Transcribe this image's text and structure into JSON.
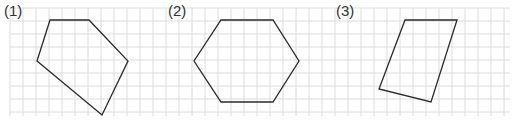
{
  "problems": [
    {
      "label": "(1)",
      "shape": "pentagon",
      "points": "50,20 89,20 128,61 102,115 37,61"
    },
    {
      "label": "(2)",
      "shape": "hexagon",
      "points": "221,20 273,20 299,61 273,102 221,102 194,61"
    },
    {
      "label": "(3)",
      "shape": "quadrilateral",
      "points": "405,20 457,20 431,102 379,89"
    }
  ],
  "grid": {
    "cell": 13,
    "x0": 10,
    "y0": 8,
    "x1": 510,
    "y1": 116,
    "color": "#dcdcdc"
  },
  "colors": {
    "stroke": "#2a2a2a",
    "label": "#333333"
  }
}
